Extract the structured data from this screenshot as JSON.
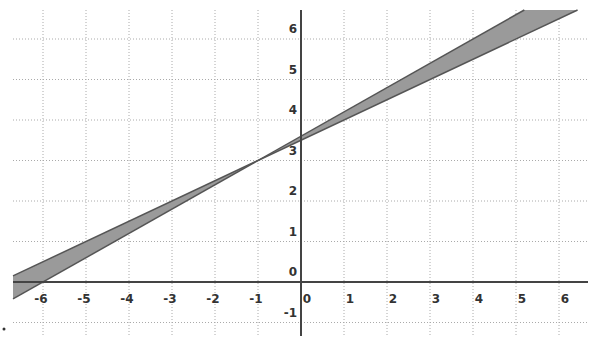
{
  "chart_data": {
    "type": "line",
    "title": "",
    "xlabel": "",
    "ylabel": "",
    "xlim": [
      -6.65,
      6.35
    ],
    "ylim": [
      -1.5,
      6.75
    ],
    "grid": true,
    "x_ticks": [
      "-6",
      "-5",
      "-4",
      "-3",
      "-2",
      "-1",
      "0",
      "1",
      "2",
      "3",
      "4",
      "5",
      "6"
    ],
    "y_ticks": [
      "-1",
      "0",
      "1",
      "2",
      "3",
      "4",
      "5",
      "6"
    ],
    "series": [
      {
        "name": "line-a",
        "slope": 0.6,
        "intercept": 3.6,
        "color": "#555555"
      },
      {
        "name": "line-b",
        "slope": 0.5,
        "intercept": 3.5,
        "color": "#555555"
      }
    ],
    "shaded_region": {
      "between": [
        "line-a",
        "line-b"
      ],
      "color": "#9a9a9a"
    },
    "intersection": {
      "x": -1,
      "y": 3
    }
  }
}
